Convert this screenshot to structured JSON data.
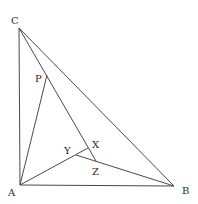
{
  "diagram": {
    "points": {
      "A": {
        "label": "A",
        "x": 20,
        "y": 185,
        "lx": 8,
        "ly": 196
      },
      "B": {
        "label": "B",
        "x": 174,
        "y": 186,
        "lx": 182,
        "ly": 194
      },
      "C": {
        "label": "C",
        "x": 19,
        "y": 28,
        "lx": 11,
        "ly": 24
      },
      "P": {
        "label": "P",
        "x": 47,
        "y": 75,
        "lx": 35,
        "ly": 82
      },
      "X": {
        "label": "X",
        "x": 88,
        "y": 148,
        "lx": 92,
        "ly": 148
      },
      "Y": {
        "label": "Y",
        "x": 76,
        "y": 155,
        "lx": 64,
        "ly": 154
      },
      "Z": {
        "label": "Z",
        "x": 96,
        "y": 161,
        "lx": 92,
        "ly": 175
      }
    },
    "segments": [
      {
        "name": "side-ac",
        "from": "A",
        "to": "C"
      },
      {
        "name": "side-ab",
        "from": "A",
        "to": "B"
      },
      {
        "name": "side-cb",
        "from": "C",
        "to": "B"
      },
      {
        "name": "segment-ap",
        "from": "A",
        "to": "P"
      },
      {
        "name": "segment-cz",
        "from": "C",
        "to": "Z"
      },
      {
        "name": "segment-ax",
        "from": "A",
        "to": "X"
      },
      {
        "name": "segment-yb",
        "from": "Y",
        "to": "B"
      }
    ]
  }
}
